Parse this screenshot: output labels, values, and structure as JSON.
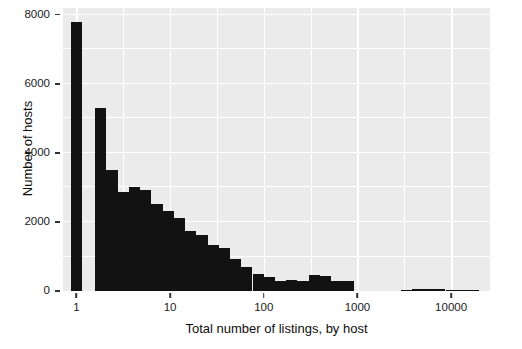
{
  "chart_data": {
    "type": "bar",
    "title": "",
    "subtitle": "",
    "xlabel": "Total number of listings, by host",
    "ylabel": "Number of hosts",
    "xscale": "log10",
    "yscale": "linear",
    "xlim": [
      0.72,
      26000
    ],
    "ylim": [
      0,
      8200
    ],
    "grid": true,
    "legend": null,
    "legend_position": "none",
    "panel_background": "#ebebeb",
    "bar_color": "#121212",
    "gridline_color": "#ffffff",
    "x_ticks": [
      {
        "value": 1,
        "label": "1"
      },
      {
        "value": 10,
        "label": "10"
      },
      {
        "value": 100,
        "label": "100"
      },
      {
        "value": 1000,
        "label": "1000"
      },
      {
        "value": 10000,
        "label": "10000"
      }
    ],
    "y_ticks": [
      {
        "value": 0,
        "label": "0"
      },
      {
        "value": 2000,
        "label": "2000"
      },
      {
        "value": 4000,
        "label": "4000"
      },
      {
        "value": 6000,
        "label": "6000"
      },
      {
        "value": 8000,
        "label": "8000"
      }
    ],
    "y_minor_gridlines": [
      1000,
      3000,
      5000,
      7000
    ],
    "x_minor_gridlines": [
      3.162,
      31.62,
      316.2,
      3162
    ],
    "bins": [
      {
        "x_start": 0.871,
        "x_end": 1.148,
        "center": 1,
        "value": 7790
      },
      {
        "x_start": 1.585,
        "x_end": 2.089,
        "center": 1.82,
        "value": 5310
      },
      {
        "x_start": 2.089,
        "x_end": 2.754,
        "center": 2.4,
        "value": 3510
      },
      {
        "x_start": 2.754,
        "x_end": 3.631,
        "center": 3.16,
        "value": 2880
      },
      {
        "x_start": 3.631,
        "x_end": 4.786,
        "center": 4.17,
        "value": 3020
      },
      {
        "x_start": 4.786,
        "x_end": 6.31,
        "center": 5.5,
        "value": 2940
      },
      {
        "x_start": 6.31,
        "x_end": 8.318,
        "center": 7.24,
        "value": 2530
      },
      {
        "x_start": 8.318,
        "x_end": 10.96,
        "center": 9.55,
        "value": 2330
      },
      {
        "x_start": 10.96,
        "x_end": 14.45,
        "center": 12.6,
        "value": 2110
      },
      {
        "x_start": 14.45,
        "x_end": 19.05,
        "center": 16.6,
        "value": 1740
      },
      {
        "x_start": 19.05,
        "x_end": 25.12,
        "center": 21.9,
        "value": 1620
      },
      {
        "x_start": 25.12,
        "x_end": 33.11,
        "center": 28.8,
        "value": 1330
      },
      {
        "x_start": 33.11,
        "x_end": 43.65,
        "center": 38.0,
        "value": 1250
      },
      {
        "x_start": 43.65,
        "x_end": 57.54,
        "center": 50.1,
        "value": 920
      },
      {
        "x_start": 57.54,
        "x_end": 75.86,
        "center": 66.1,
        "value": 700
      },
      {
        "x_start": 75.86,
        "x_end": 100.0,
        "center": 87.1,
        "value": 490
      },
      {
        "x_start": 100.0,
        "x_end": 131.8,
        "center": 114.8,
        "value": 400
      },
      {
        "x_start": 131.8,
        "x_end": 173.8,
        "center": 151.4,
        "value": 290
      },
      {
        "x_start": 173.8,
        "x_end": 229.1,
        "center": 199.5,
        "value": 320
      },
      {
        "x_start": 229.1,
        "x_end": 302.0,
        "center": 263.0,
        "value": 300
      },
      {
        "x_start": 302.0,
        "x_end": 398.1,
        "center": 346.7,
        "value": 470
      },
      {
        "x_start": 398.1,
        "x_end": 524.8,
        "center": 457.1,
        "value": 440
      },
      {
        "x_start": 524.8,
        "x_end": 691.8,
        "center": 602.6,
        "value": 300
      },
      {
        "x_start": 691.8,
        "x_end": 912.0,
        "center": 794.3,
        "value": 290
      },
      {
        "x_start": 2884,
        "x_end": 3802,
        "center": 3311,
        "value": 35
      },
      {
        "x_start": 3802,
        "x_end": 5012,
        "center": 4365,
        "value": 60
      },
      {
        "x_start": 5012,
        "x_end": 6607,
        "center": 5754,
        "value": 55
      },
      {
        "x_start": 6607,
        "x_end": 8710,
        "center": 7586,
        "value": 45
      },
      {
        "x_start": 8710,
        "x_end": 11482,
        "center": 10000,
        "value": 30
      },
      {
        "x_start": 11482,
        "x_end": 15136,
        "center": 13183,
        "value": 20
      },
      {
        "x_start": 15136,
        "x_end": 19953,
        "center": 17378,
        "value": 15
      }
    ]
  }
}
